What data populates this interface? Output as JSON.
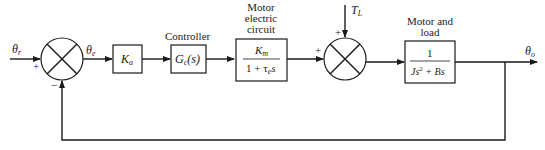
{
  "diagram": {
    "type": "control-system-block-diagram",
    "input_signal": "θr",
    "error_signal": "θe",
    "output_signal": "θo",
    "disturbance_signal": "TL",
    "summing_junctions": [
      {
        "id": "sum1",
        "signs": {
          "left": "+",
          "bottom": "−"
        }
      },
      {
        "id": "sum2",
        "signs": {
          "left": "+",
          "top": "+"
        }
      }
    ],
    "blocks": [
      {
        "id": "amp",
        "title": "",
        "tf": "Ka"
      },
      {
        "id": "controller",
        "title": "Controller",
        "tf": "Gc(s)"
      },
      {
        "id": "motor-electric",
        "title_lines": [
          "Motor",
          "electric",
          "circuit"
        ],
        "numerator": "Km",
        "denominator": "1 + τe s"
      },
      {
        "id": "motor-load",
        "title_lines": [
          "Motor and",
          "load"
        ],
        "numerator": "1",
        "denominator": "Js² + Bs"
      }
    ]
  },
  "labels": {
    "theta_r_main": "θ",
    "theta_r_sub": "r",
    "theta_e_main": "θ",
    "theta_e_sub": "e",
    "theta_o_main": "θ",
    "theta_o_sub": "o",
    "tl_main": "T",
    "tl_sub": "L",
    "ka_main": "K",
    "ka_sub": "a",
    "gc_main": "G",
    "gc_sub": "c",
    "gc_arg": "(s)",
    "controller_title": "Controller",
    "mec_title_1": "Motor",
    "mec_title_2": "electric",
    "mec_title_3": "circuit",
    "mec_num_main": "K",
    "mec_num_sub": "m",
    "mec_den_pre": "1 + τ",
    "mec_den_sub": "e",
    "mec_den_post": "s",
    "ml_title_1": "Motor and",
    "ml_title_2": "load",
    "ml_num": "1",
    "ml_den_j": "Js",
    "ml_den_exp": "2",
    "ml_den_rest": " + Bs",
    "plus": "+",
    "minus": "−"
  }
}
